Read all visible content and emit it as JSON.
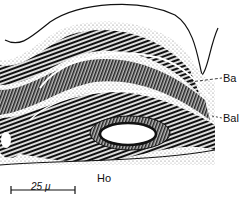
{
  "figure": {
    "type": "histological drawing (micrograph illustration)",
    "labels": {
      "ba": "Ba",
      "bal": "Bal",
      "ho": "Ho"
    },
    "scale_bar": {
      "text": "25 μ",
      "length_px": 64
    },
    "colors": {
      "ink": "#111111",
      "stipple": "#9a9a9a",
      "background": "#ffffff"
    }
  }
}
